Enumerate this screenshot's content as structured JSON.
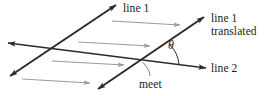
{
  "figure": {
    "width": 265,
    "height": 96,
    "background_color": "#ffffff",
    "labels": {
      "line1": "line 1",
      "line1_translated_l1": "line 1",
      "line1_translated_l2": "translated",
      "line2": "line 2",
      "meet": "meet",
      "angle": "θ"
    },
    "colors": {
      "line_stroke": "#2b2b2b",
      "translation_arrow": "#9a9a9a",
      "leader": "#6e6e6e",
      "angle_arc": "#2b2b2b",
      "text": "#1a1a1a"
    },
    "geometry": {
      "line1": {
        "x1": 10,
        "y1": 76,
        "x2": 116,
        "y2": 5,
        "double_arrow": true
      },
      "line1_translated": {
        "x1": 98,
        "y1": 89,
        "x2": 204,
        "y2": 17,
        "double_arrow": true
      },
      "line2": {
        "x1": 8,
        "y1": 43,
        "x2": 206,
        "y2": 68,
        "double_arrow": true
      },
      "intersection_meet": {
        "x": 148,
        "y": 60
      },
      "angle_arc_radius": 32,
      "translation_arrows": [
        {
          "x1": 112,
          "y1": 21,
          "x2": 180,
          "y2": 25
        },
        {
          "x1": 78,
          "y1": 42,
          "x2": 150,
          "y2": 46
        },
        {
          "x1": 52,
          "y1": 61,
          "x2": 124,
          "y2": 65
        },
        {
          "x1": 22,
          "y1": 79,
          "x2": 90,
          "y2": 83
        }
      ],
      "meet_leader": {
        "x1": 150,
        "y1": 76,
        "x2": 143,
        "y2": 63
      }
    }
  }
}
